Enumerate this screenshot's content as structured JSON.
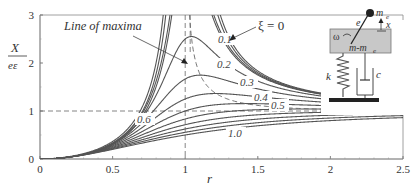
{
  "chart_data": {
    "type": "line",
    "title": "",
    "xlabel": "r",
    "ylabel": "X/(eε)",
    "ylabel_numerator": "X",
    "ylabel_denominator": "eε",
    "xlim": [
      0,
      2.5
    ],
    "ylim": [
      0,
      3
    ],
    "x_ticks": [
      "0",
      "0.5",
      "1",
      "1.5",
      "2",
      "2.5"
    ],
    "y_ticks": [
      "0",
      "1",
      "2",
      "3"
    ],
    "grid": false,
    "reference_lines": [
      {
        "orientation": "vertical",
        "x": 1,
        "style": "dashed"
      },
      {
        "orientation": "horizontal",
        "y": 1,
        "style": "dashed"
      }
    ],
    "annotations": {
      "line_of_maxima": "Line of maxima",
      "xi_zero": "ξ = 0"
    },
    "curve_labels": [
      "0.1",
      "0.2",
      "0.3",
      "0.4",
      "0.5",
      "0.6",
      "1.0"
    ],
    "x_samples": [
      0,
      0.25,
      0.5,
      0.75,
      0.9,
      1.0,
      1.1,
      1.25,
      1.5,
      1.75,
      2.0,
      2.25,
      2.5
    ],
    "series": [
      {
        "name": "ξ = 0",
        "xi": 0.0,
        "values": [
          0,
          0.067,
          0.333,
          1.286,
          3.0,
          3.0,
          3.0,
          2.778,
          1.8,
          1.485,
          1.333,
          1.246,
          1.19
        ]
      },
      {
        "name": "ξ = 0.1",
        "xi": 0.1,
        "values": [
          0,
          0.066,
          0.331,
          1.234,
          2.71,
          3.0,
          2.99,
          2.503,
          1.772,
          1.47,
          1.324,
          1.241,
          1.186
        ]
      },
      {
        "name": "ξ = 0.2",
        "xi": 0.2,
        "values": [
          0,
          0.066,
          0.326,
          1.113,
          1.95,
          2.5,
          2.07,
          1.93,
          1.69,
          1.43,
          1.3,
          1.225,
          1.175
        ]
      },
      {
        "name": "ξ = 0.3",
        "xi": 0.3,
        "values": [
          0,
          0.066,
          0.318,
          0.98,
          1.45,
          1.667,
          1.6,
          1.53,
          1.4,
          1.36,
          1.26,
          1.2,
          1.158
        ]
      },
      {
        "name": "ξ = 0.4",
        "xi": 0.4,
        "values": [
          0,
          0.065,
          0.308,
          0.85,
          1.14,
          1.25,
          1.28,
          1.27,
          1.3,
          1.25,
          1.2,
          1.16,
          1.136
        ]
      },
      {
        "name": "ξ = 0.5",
        "xi": 0.5,
        "values": [
          0,
          0.065,
          0.298,
          0.74,
          0.93,
          1.0,
          1.06,
          1.1,
          1.12,
          1.14,
          1.14,
          1.12,
          1.111
        ]
      },
      {
        "name": "ξ = 0.6",
        "xi": 0.6,
        "values": [
          0,
          0.064,
          0.286,
          0.64,
          0.78,
          0.833,
          0.88,
          0.94,
          1.0,
          1.03,
          1.05,
          1.06,
          1.06
        ]
      },
      {
        "name": "ξ = 0.7",
        "xi": 0.7,
        "values": [
          0,
          0.063,
          0.274,
          0.56,
          0.67,
          0.714,
          0.76,
          0.82,
          0.89,
          0.94,
          0.97,
          0.99,
          1.0
        ]
      },
      {
        "name": "ξ = 0.8",
        "xi": 0.8,
        "values": [
          0,
          0.062,
          0.262,
          0.5,
          0.58,
          0.625,
          0.67,
          0.72,
          0.8,
          0.86,
          0.9,
          0.93,
          0.95
        ]
      },
      {
        "name": "ξ = 0.9",
        "xi": 0.9,
        "values": [
          0,
          0.061,
          0.25,
          0.44,
          0.52,
          0.556,
          0.59,
          0.65,
          0.72,
          0.79,
          0.83,
          0.87,
          0.9
        ]
      },
      {
        "name": "ξ = 1.0",
        "xi": 1.0,
        "values": [
          0,
          0.059,
          0.2,
          0.36,
          0.45,
          0.5,
          0.55,
          0.61,
          0.69,
          0.75,
          0.8,
          0.84,
          0.86
        ]
      }
    ]
  },
  "inset": {
    "title": "rotating unbalance schematic",
    "labels": {
      "eccentric_mass": "m",
      "eccentric_mass_sub": "e",
      "eccentricity": "e",
      "displacement": "x",
      "omega": "ω",
      "body_mass": "m-m",
      "body_mass_sub": "e",
      "spring": "k",
      "damper": "c"
    }
  }
}
